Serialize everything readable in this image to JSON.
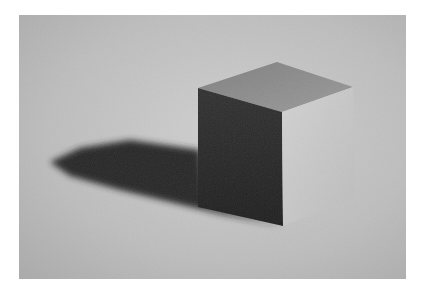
{
  "image": {
    "subject": "Pencil drawing of a cube casting a shadow",
    "colors": {
      "background_light": "#cfcfcf",
      "background_dark": "#a9a9a9",
      "top_face": "#8e8e8e",
      "left_face": "#2a2a2a",
      "right_face": "#c9c9c9",
      "shadow": "#262626"
    }
  }
}
